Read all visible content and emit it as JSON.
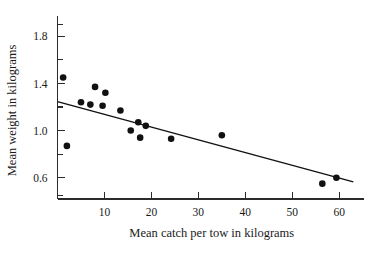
{
  "chart_data": {
    "type": "scatter",
    "title": "",
    "xlabel": "Mean catch per tow in kilograms",
    "ylabel": "Mean weight in kilograms",
    "xlim": [
      0,
      64
    ],
    "ylim": [
      0.42,
      1.92
    ],
    "grid": false,
    "legend": null,
    "x_ticks": [
      10,
      20,
      30,
      40,
      50,
      60
    ],
    "x_tick_labels": [
      "10",
      "20",
      "30",
      "40",
      "50",
      "60"
    ],
    "x_minor_ticks": [
      5,
      15,
      25,
      35,
      45,
      55
    ],
    "y_ticks": [
      0.6,
      1.0,
      1.4,
      1.8
    ],
    "y_tick_labels": [
      "0.6",
      "1.0",
      "1.4",
      "1.8"
    ],
    "y_minor_ticks": [
      0.8,
      1.2,
      1.6
    ],
    "point_color": "#111111",
    "line_color": "#111111",
    "axis_color": "#2b2b2b",
    "marker_size": 3.3,
    "points": [
      {
        "x": 1.2,
        "y": 1.45
      },
      {
        "x": 2.0,
        "y": 0.87
      },
      {
        "x": 5.0,
        "y": 1.24
      },
      {
        "x": 7.0,
        "y": 1.22
      },
      {
        "x": 8.0,
        "y": 1.37
      },
      {
        "x": 9.6,
        "y": 1.21
      },
      {
        "x": 10.2,
        "y": 1.32
      },
      {
        "x": 13.4,
        "y": 1.17
      },
      {
        "x": 15.6,
        "y": 1.0
      },
      {
        "x": 17.2,
        "y": 1.07
      },
      {
        "x": 17.6,
        "y": 0.94
      },
      {
        "x": 18.8,
        "y": 1.04
      },
      {
        "x": 24.2,
        "y": 0.93
      },
      {
        "x": 35.0,
        "y": 0.96
      },
      {
        "x": 56.4,
        "y": 0.55
      },
      {
        "x": 59.4,
        "y": 0.6
      }
    ],
    "fit_line": {
      "kind": "linear-regression",
      "x_start": 0.0,
      "y_start": 1.245,
      "x_end": 63.0,
      "y_end": 0.565
    }
  }
}
